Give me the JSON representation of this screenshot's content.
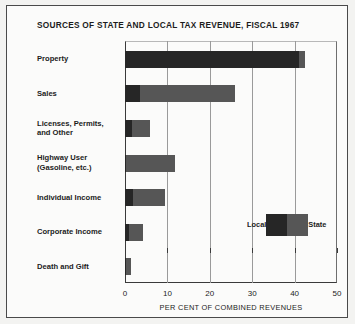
{
  "chart_data": {
    "type": "bar",
    "orientation": "horizontal",
    "stacked": true,
    "title": "SOURCES OF STATE AND LOCAL TAX REVENUE, FISCAL 1967",
    "xlabel": "PER CENT OF COMBINED REVENUES",
    "ylabel": "",
    "xlim": [
      0,
      50
    ],
    "xticks": [
      0,
      10,
      20,
      30,
      40,
      50
    ],
    "xtick_labels": [
      "0",
      "10",
      "20",
      "30",
      "40",
      "50"
    ],
    "grid": "vertical",
    "legend_position": "inside-right",
    "categories": [
      "Property",
      "Sales",
      "Licenses, Permits, and Other",
      "Highway User (Gasoline, etc.)",
      "Individual Income",
      "Corporate Income",
      "Death and Gift"
    ],
    "category_lines": [
      [
        "Property"
      ],
      [
        "Sales"
      ],
      [
        "Licenses, Permits,",
        "and Other"
      ],
      [
        "Highway User",
        "(Gasoline, etc.)"
      ],
      [
        "Individual Income"
      ],
      [
        "Corporate Income"
      ],
      [
        "Death and Gift"
      ]
    ],
    "series": [
      {
        "name": "Local",
        "color": "#262626",
        "values": [
          41.0,
          3.5,
          1.7,
          0.3,
          2.0,
          1.0,
          0.3
        ]
      },
      {
        "name": "State",
        "color": "#565656",
        "values": [
          1.5,
          22.5,
          4.3,
          11.5,
          7.5,
          3.2,
          1.1
        ]
      }
    ],
    "totals": [
      42.5,
      26.0,
      6.0,
      11.8,
      9.5,
      4.2,
      1.4
    ]
  },
  "legend": {
    "local_label": "Local",
    "state_label": "State"
  },
  "colors": {
    "local": "#262626",
    "state": "#565656",
    "axis": "#3a3a3a",
    "grid": "#9a9a9a",
    "background": "#fbfbfa",
    "text": "#1c1c1c"
  }
}
